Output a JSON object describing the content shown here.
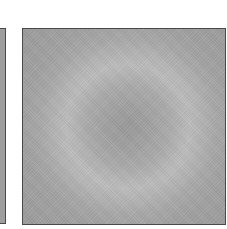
{
  "image": {
    "description": "Grayscale square with concentric radial rings; a darker center, lighter ring band, darker outer field",
    "panels": [
      {
        "name": "left-partial-panel",
        "color": "#9e9e9e"
      },
      {
        "name": "main-radial-panel",
        "center_color": "#9a9a9a",
        "ring_color": "#bdbdbd",
        "outer_color": "#9d9d9d",
        "border_color": "#4a4a4a"
      }
    ]
  }
}
